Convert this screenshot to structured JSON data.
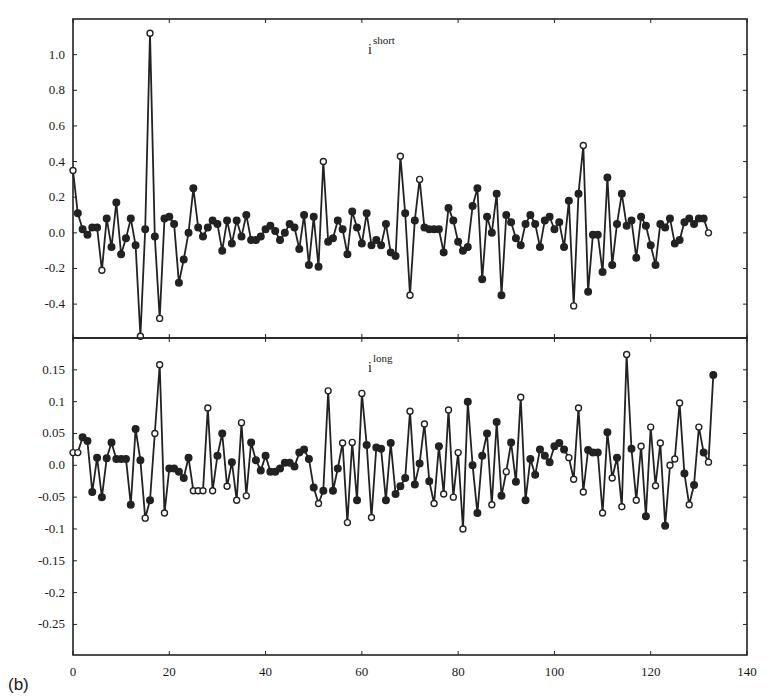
{
  "panel_label": "(b)",
  "chart_data": [
    {
      "type": "line",
      "title": "",
      "series_label": {
        "base": "i",
        "superscript": "short"
      },
      "xlabel": "",
      "ylabel": "",
      "xlim": [
        0,
        140
      ],
      "ylim": [
        -0.59,
        1.2
      ],
      "x_ticks": [
        0,
        20,
        40,
        60,
        80,
        100,
        120,
        140
      ],
      "y_ticks": [
        1.0,
        0.8,
        0.6,
        0.4,
        0.2,
        0.0,
        -0.2,
        -0.4
      ],
      "y_tick_labels": [
        "1.0",
        "0.8",
        "0.6",
        "0.4",
        "0.2",
        "0.0",
        "-0.2",
        "-0.4"
      ],
      "grid": false,
      "marker": "circle",
      "x_start": 0,
      "values": [
        0.35,
        0.11,
        0.02,
        -0.01,
        0.03,
        0.03,
        -0.21,
        0.08,
        -0.08,
        0.17,
        -0.12,
        -0.03,
        0.08,
        -0.07,
        -0.58,
        0.02,
        1.12,
        -0.02,
        -0.48,
        0.08,
        0.09,
        0.05,
        -0.28,
        -0.15,
        0.0,
        0.25,
        0.03,
        -0.02,
        0.03,
        0.07,
        0.05,
        -0.1,
        0.07,
        -0.06,
        0.07,
        -0.02,
        0.1,
        -0.04,
        -0.04,
        -0.02,
        0.02,
        0.04,
        0.01,
        -0.04,
        0.0,
        0.05,
        0.03,
        -0.09,
        0.1,
        -0.18,
        0.09,
        -0.19,
        0.4,
        -0.05,
        -0.03,
        0.07,
        0.02,
        -0.12,
        0.12,
        0.03,
        -0.06,
        0.11,
        -0.07,
        -0.04,
        -0.07,
        0.05,
        -0.11,
        -0.13,
        0.43,
        0.11,
        -0.35,
        0.07,
        0.3,
        0.03,
        0.02,
        0.02,
        0.02,
        -0.11,
        0.14,
        0.07,
        -0.05,
        -0.1,
        -0.08,
        0.15,
        0.25,
        -0.26,
        0.09,
        0.0,
        0.22,
        -0.35,
        0.1,
        0.06,
        -0.03,
        -0.07,
        0.05,
        0.1,
        0.05,
        -0.08,
        0.07,
        0.09,
        0.02,
        0.06,
        -0.08,
        0.18,
        -0.41,
        0.22,
        0.49,
        -0.33,
        -0.01,
        -0.01,
        -0.22,
        0.31,
        -0.18,
        0.05,
        0.22,
        0.04,
        0.07,
        -0.14,
        0.09,
        0.04,
        -0.07,
        -0.18,
        0.05,
        0.03,
        0.08,
        -0.06,
        -0.04,
        0.06,
        0.08,
        0.05,
        0.08,
        0.08,
        0.0
      ],
      "open_markers": [
        0,
        6,
        14,
        16,
        18,
        52,
        68,
        70,
        72,
        104,
        106,
        132
      ]
    },
    {
      "type": "line",
      "title": "",
      "series_label": {
        "base": "i",
        "superscript": "long"
      },
      "xlabel": "",
      "ylabel": "",
      "xlim": [
        0,
        140
      ],
      "ylim": [
        -0.298,
        0.2
      ],
      "x_ticks": [
        0,
        20,
        40,
        60,
        80,
        100,
        120,
        140
      ],
      "x_tick_labels": [
        "0",
        "20",
        "40",
        "60",
        "80",
        "100",
        "120",
        "140"
      ],
      "y_ticks": [
        0.15,
        0.1,
        0.05,
        0.0,
        -0.05,
        -0.1,
        -0.15,
        -0.2,
        -0.25
      ],
      "y_tick_labels": [
        "0.15",
        "0.1",
        "0.05",
        "0.0",
        "-0.05",
        "-0.1",
        "-0.15",
        "-0.2",
        "-0.25"
      ],
      "grid": false,
      "marker": "circle",
      "x_start": 0,
      "values": [
        0.02,
        0.02,
        0.044,
        0.038,
        -0.042,
        0.012,
        -0.05,
        0.011,
        0.036,
        0.01,
        0.01,
        0.01,
        -0.062,
        0.057,
        0.008,
        -0.083,
        -0.055,
        0.05,
        0.158,
        -0.075,
        -0.005,
        -0.005,
        -0.01,
        -0.02,
        0.012,
        -0.04,
        -0.04,
        -0.04,
        0.09,
        -0.04,
        0.015,
        0.05,
        -0.033,
        0.005,
        -0.055,
        0.067,
        -0.048,
        0.036,
        0.008,
        -0.008,
        0.015,
        -0.01,
        -0.01,
        -0.005,
        0.004,
        0.004,
        -0.002,
        0.02,
        0.025,
        0.01,
        -0.035,
        -0.06,
        -0.04,
        0.117,
        -0.04,
        -0.005,
        0.035,
        -0.09,
        0.036,
        -0.055,
        0.113,
        0.032,
        -0.082,
        0.028,
        0.026,
        -0.055,
        0.035,
        -0.045,
        -0.033,
        -0.02,
        0.085,
        -0.03,
        0.003,
        0.065,
        -0.025,
        -0.06,
        0.03,
        -0.045,
        0.087,
        -0.05,
        0.02,
        -0.1,
        0.1,
        0.0,
        -0.075,
        0.015,
        0.05,
        -0.062,
        0.068,
        -0.048,
        -0.01,
        0.036,
        -0.026,
        0.107,
        -0.055,
        0.01,
        -0.015,
        0.025,
        0.015,
        0.005,
        0.03,
        0.035,
        0.025,
        0.012,
        -0.022,
        0.09,
        -0.042,
        0.024,
        0.02,
        0.02,
        -0.075,
        0.052,
        -0.02,
        0.012,
        -0.065,
        0.174,
        0.026,
        -0.055,
        0.03,
        -0.08,
        0.06,
        -0.032,
        0.035,
        -0.095,
        0.0,
        0.01,
        0.098,
        -0.013,
        -0.062,
        -0.031,
        0.06,
        0.02,
        0.005,
        0.142
      ],
      "open_markers": [
        0,
        1,
        15,
        17,
        18,
        19,
        25,
        26,
        27,
        28,
        29,
        32,
        34,
        35,
        36,
        51,
        53,
        56,
        57,
        58,
        60,
        62,
        70,
        73,
        75,
        77,
        78,
        79,
        80,
        81,
        87,
        90,
        93,
        103,
        104,
        105,
        106,
        110,
        112,
        114,
        115,
        117,
        118,
        120,
        121,
        122,
        124,
        125,
        126,
        128,
        130,
        132
      ]
    }
  ]
}
